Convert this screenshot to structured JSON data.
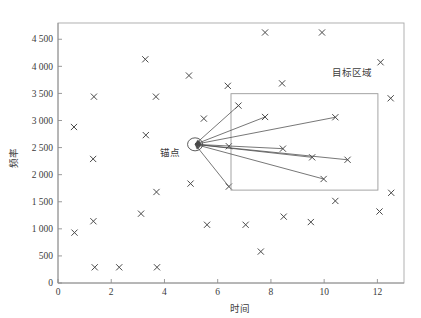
{
  "chart_data": {
    "type": "scatter",
    "title": "",
    "xlabel": "时间",
    "ylabel": "频率",
    "xlim": [
      0,
      13
    ],
    "ylim": [
      0,
      4800
    ],
    "grid": false,
    "legend_position": "none",
    "x_ticks": [
      "0",
      "2",
      "4",
      "6",
      "8",
      "10",
      "12"
    ],
    "x_tick_values": [
      0,
      2,
      4,
      6,
      8,
      10,
      12
    ],
    "y_ticks": [
      "0",
      "500",
      "1 000",
      "1 500",
      "2 000",
      "2 500",
      "3 000",
      "3 500",
      "4 000",
      "4 500"
    ],
    "y_tick_values": [
      0,
      500,
      1000,
      1500,
      2000,
      2500,
      3000,
      3500,
      4000,
      4500
    ],
    "marker_symbol": "x",
    "marker_color": "#4a4a4a",
    "series": [
      {
        "name": "信号点",
        "points": [
          [
            0.6,
            2880
          ],
          [
            0.62,
            930
          ],
          [
            1.35,
            3440
          ],
          [
            1.32,
            2290
          ],
          [
            1.33,
            1140
          ],
          [
            1.38,
            290
          ],
          [
            2.3,
            290
          ],
          [
            3.12,
            1280
          ],
          [
            3.28,
            4130
          ],
          [
            3.3,
            2730
          ],
          [
            3.68,
            3440
          ],
          [
            3.7,
            1680
          ],
          [
            3.72,
            290
          ],
          [
            4.92,
            3830
          ],
          [
            4.98,
            1835
          ],
          [
            5.48,
            3035
          ],
          [
            5.6,
            1075
          ],
          [
            6.38,
            3640
          ],
          [
            6.42,
            2525
          ],
          [
            7.05,
            1075
          ],
          [
            7.62,
            580
          ],
          [
            7.78,
            4625
          ],
          [
            8.42,
            3685
          ],
          [
            8.48,
            1225
          ],
          [
            9.5,
            1125
          ],
          [
            9.92,
            4625
          ],
          [
            10.42,
            1515
          ],
          [
            12.08,
            1320
          ],
          [
            12.12,
            4075
          ],
          [
            12.5,
            3410
          ],
          [
            12.52,
            1665
          ]
        ]
      },
      {
        "name": "目标点",
        "points": [
          [
            6.78,
            3275
          ],
          [
            7.78,
            3065
          ],
          [
            10.42,
            3060
          ],
          [
            8.45,
            2480
          ],
          [
            9.55,
            2320
          ],
          [
            10.88,
            2275
          ],
          [
            9.98,
            1920
          ],
          [
            6.42,
            1780
          ]
        ]
      }
    ],
    "anchor": {
      "label": "锚点",
      "x": 5.15,
      "y": 2560,
      "marker": "circle"
    },
    "region": {
      "label": "目标区域",
      "x0": 6.5,
      "x1": 12.02,
      "y0": 1715,
      "y1": 3495
    },
    "arrows": [
      {
        "from": [
          5.15,
          2560
        ],
        "to": [
          6.78,
          3275
        ]
      },
      {
        "from": [
          5.15,
          2560
        ],
        "to": [
          7.78,
          3065
        ]
      },
      {
        "from": [
          5.15,
          2560
        ],
        "to": [
          10.42,
          3060
        ]
      },
      {
        "from": [
          5.15,
          2560
        ],
        "to": [
          8.45,
          2480
        ]
      },
      {
        "from": [
          5.15,
          2560
        ],
        "to": [
          10.88,
          2275
        ]
      },
      {
        "from": [
          5.15,
          2560
        ],
        "to": [
          9.55,
          2320
        ]
      },
      {
        "from": [
          5.15,
          2560
        ],
        "to": [
          9.98,
          1920
        ]
      },
      {
        "from": [
          5.15,
          2560
        ],
        "to": [
          6.42,
          1780
        ]
      }
    ]
  }
}
